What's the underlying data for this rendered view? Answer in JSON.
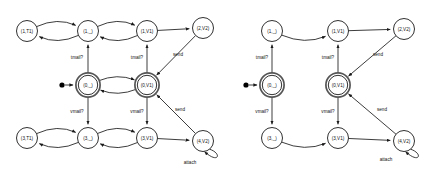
{
  "figure": {
    "kind": "two-state-machine-diagrams",
    "background_color": "#ffffff",
    "line_color": "#1a1a1a",
    "accepting_ring_color": "#555555"
  },
  "diagrams": [
    {
      "id": "left",
      "name": "full-product-automaton",
      "nodes": [
        {
          "id": "l_1T1",
          "label": "(1,T1)",
          "x": 27,
          "y": 31,
          "accepting": false,
          "initial": false
        },
        {
          "id": "l_1_",
          "label": "(1,_)",
          "x": 88,
          "y": 31,
          "accepting": false,
          "initial": false
        },
        {
          "id": "l_1V1",
          "label": "(1,V1)",
          "x": 147,
          "y": 31,
          "accepting": false,
          "initial": false
        },
        {
          "id": "l_2V2",
          "label": "(2,V2)",
          "x": 203,
          "y": 28,
          "accepting": false,
          "initial": false
        },
        {
          "id": "l_0_",
          "label": "(0,_)",
          "x": 88,
          "y": 85,
          "accepting": true,
          "initial": true
        },
        {
          "id": "l_0V1",
          "label": "(0,V1)",
          "x": 147,
          "y": 85,
          "accepting": true,
          "initial": false
        },
        {
          "id": "l_3T1",
          "label": "(3,T1)",
          "x": 27,
          "y": 138,
          "accepting": false,
          "initial": false
        },
        {
          "id": "l_3_",
          "label": "(3,_)",
          "x": 88,
          "y": 138,
          "accepting": false,
          "initial": false
        },
        {
          "id": "l_3V1",
          "label": "(3,V1)",
          "x": 147,
          "y": 138,
          "accepting": false,
          "initial": false
        },
        {
          "id": "l_4V2",
          "label": "(4,V2)",
          "x": 203,
          "y": 141,
          "accepting": false,
          "initial": false
        }
      ],
      "edge_labels": [
        {
          "text": "tmail?",
          "x": 77,
          "y": 58
        },
        {
          "text": "tmail?",
          "x": 137,
          "y": 58
        },
        {
          "text": "send",
          "x": 178,
          "y": 55
        },
        {
          "text": "vmail?",
          "x": 77,
          "y": 112
        },
        {
          "text": "vmail?",
          "x": 137,
          "y": 112
        },
        {
          "text": "send",
          "x": 180,
          "y": 110
        },
        {
          "text": "attach",
          "x": 190,
          "y": 163
        }
      ],
      "start_marker": {
        "x": 62,
        "y": 85
      }
    },
    {
      "id": "right",
      "name": "reduced-product-automaton",
      "nodes": [
        {
          "id": "r_1_",
          "label": "(1,_)",
          "x": 272,
          "y": 31,
          "accepting": false,
          "initial": false
        },
        {
          "id": "r_1V1",
          "label": "(1,V1)",
          "x": 338,
          "y": 31,
          "accepting": false,
          "initial": false
        },
        {
          "id": "r_2V2",
          "label": "(2,V2)",
          "x": 404,
          "y": 29,
          "accepting": false,
          "initial": false
        },
        {
          "id": "r_0_",
          "label": "(0,_)",
          "x": 272,
          "y": 85,
          "accepting": true,
          "initial": true
        },
        {
          "id": "r_0V1",
          "label": "(0,V1)",
          "x": 338,
          "y": 85,
          "accepting": true,
          "initial": false
        },
        {
          "id": "r_3_",
          "label": "(3,_)",
          "x": 272,
          "y": 138,
          "accepting": false,
          "initial": false
        },
        {
          "id": "r_3V1",
          "label": "(3,V1)",
          "x": 338,
          "y": 138,
          "accepting": false,
          "initial": false
        },
        {
          "id": "r_4V2",
          "label": "(4,V2)",
          "x": 404,
          "y": 141,
          "accepting": false,
          "initial": false
        }
      ],
      "edge_labels": [
        {
          "text": "tmail?",
          "x": 262,
          "y": 58
        },
        {
          "text": "tmail?",
          "x": 328,
          "y": 58
        },
        {
          "text": "send",
          "x": 378,
          "y": 55
        },
        {
          "text": "vmail?",
          "x": 262,
          "y": 112
        },
        {
          "text": "vmail?",
          "x": 328,
          "y": 112
        },
        {
          "text": "send",
          "x": 382,
          "y": 110
        },
        {
          "text": "attach",
          "x": 386,
          "y": 160
        }
      ],
      "start_marker": {
        "x": 246,
        "y": 85
      }
    }
  ]
}
